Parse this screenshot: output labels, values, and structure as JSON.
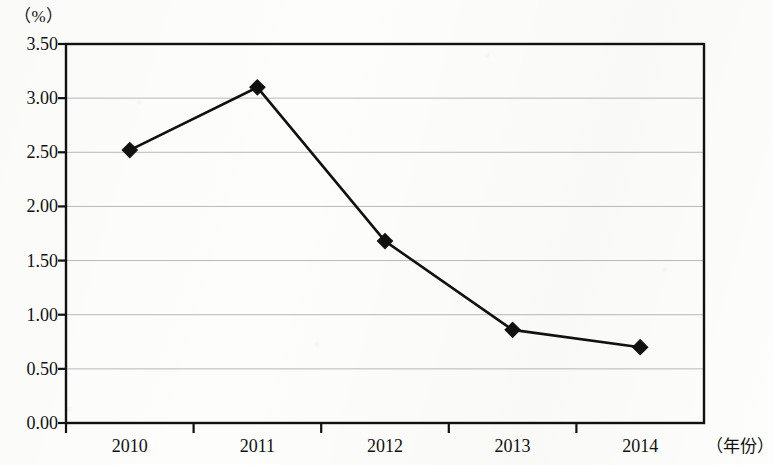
{
  "chart_data": {
    "type": "line",
    "title": "",
    "xlabel": "（年份）",
    "ylabel": "（%）",
    "categories": [
      "2010",
      "2011",
      "2012",
      "2013",
      "2014"
    ],
    "values": [
      2.52,
      3.1,
      1.68,
      0.86,
      0.7
    ],
    "series": [
      {
        "name": "",
        "values": [
          2.52,
          3.1,
          1.68,
          0.86,
          0.7
        ]
      }
    ],
    "ylim": [
      0.0,
      3.5
    ],
    "ytick_labels": [
      "0.00",
      "0.50",
      "1.00",
      "1.50",
      "2.00",
      "2.50",
      "3.00",
      "3.50"
    ],
    "ytick_values": [
      0.0,
      0.5,
      1.0,
      1.5,
      2.0,
      2.5,
      3.0,
      3.5
    ],
    "grid": true,
    "legend": "none",
    "marker": "diamond",
    "line_color": "#111111",
    "marker_color": "#111111",
    "grid_color": "#b9b9b9",
    "axis_color": "#111111"
  }
}
